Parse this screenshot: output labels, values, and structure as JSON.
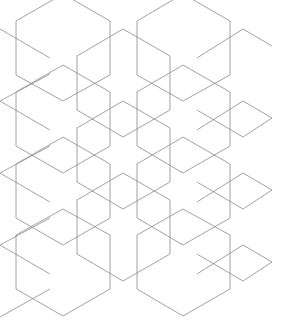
{
  "colors": {
    "background": "#ffffff",
    "stroke": "#8a8a8a"
  },
  "hexagons": [
    "16,21 63,-6 110,21 110,75 63,101 16,75",
    "137,21 183,-6 230,21 230,75 183,101 137,75",
    "77,56 123,29 170,56 170,110 123,137 77,110",
    "16,92 63,65 110,92 110,146 63,173 16,146",
    "137,92 183,65 230,92 230,146 183,173 137,146",
    "77,128 123,101 170,128 170,182 123,209 77,182",
    "16,164 63,137 110,164 110,218 63,245 16,218",
    "137,164 183,137 230,164 230,218 183,245 137,218",
    "77,200 123,173 170,200 170,254 123,281 77,254",
    "16,235 63,209 110,235 110,289 63,316 16,289",
    "137,235 183,209 230,235 230,289 183,316 137,289"
  ],
  "lines": [
    "0,29 50,58",
    "0,101 50,74",
    "0,101 50,130",
    "0,173 50,146",
    "0,173 50,202",
    "0,245 50,218",
    "0,245 50,274",
    "0,317 50,289",
    "197,58 243,29 272,46",
    "197,130 243,101 272,118 243,137 197,110",
    "197,202 243,173 272,190 243,209 197,182",
    "197,274 243,245 272,262 243,281 197,254"
  ]
}
